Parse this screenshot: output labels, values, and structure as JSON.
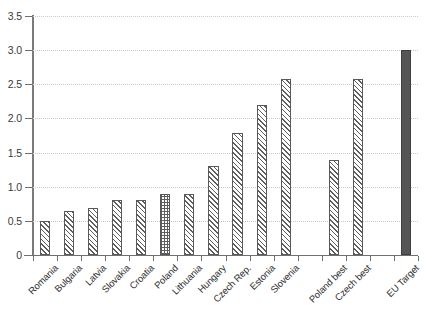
{
  "chart_data": {
    "type": "bar",
    "title": "",
    "xlabel": "",
    "ylabel": "",
    "ylim": [
      0,
      3.5
    ],
    "grid": true,
    "legend": "none",
    "y_ticks": [
      "0",
      "0.5",
      "1.0",
      "1.5",
      "2.0",
      "2.5",
      "3.0",
      "3.5"
    ],
    "y_tick_values": [
      0,
      0.5,
      1.0,
      1.5,
      2.0,
      2.5,
      3.0,
      3.5
    ],
    "categories": [
      "Romania",
      "Bulgaria",
      "Latvia",
      "Slovakia",
      "Croatia",
      "Poland",
      "Lithuania",
      "Hungary",
      "Czech Rep.",
      "Estonia",
      "Slovenia",
      "",
      "Poland best",
      "Czech best",
      "",
      "EU Target"
    ],
    "values": [
      0.5,
      0.64,
      0.69,
      0.8,
      0.8,
      0.9,
      0.9,
      1.3,
      1.79,
      2.2,
      2.58,
      null,
      1.39,
      2.58,
      null,
      3.0
    ],
    "bar_styles": [
      "hatch",
      "hatch",
      "hatch",
      "hatch",
      "hatch",
      "checker",
      "hatch",
      "hatch",
      "hatch",
      "hatch",
      "hatch",
      "none",
      "hatch",
      "hatch",
      "none",
      "solid"
    ],
    "colors": {
      "hatch_line": "#5d5d5d",
      "bar_border": "#595959",
      "solid_bar": "#555555",
      "gridline": "#c9c9c9",
      "axis": "#6f6f6f",
      "text": "#2e2e2e",
      "background": "#ffffff"
    }
  }
}
